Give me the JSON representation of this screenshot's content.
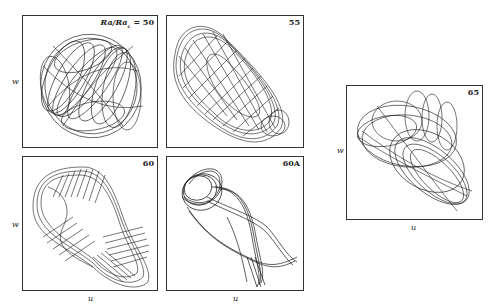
{
  "figure": {
    "panels": [
      {
        "id": "p50",
        "label": "Ra/Ra_c = 50",
        "label_main": "Ra/Ra",
        "label_sub": "c",
        "label_eq": " = 50",
        "xlabel": "",
        "ylabel": "w"
      },
      {
        "id": "p55",
        "label": "55",
        "xlabel": "",
        "ylabel": ""
      },
      {
        "id": "p60",
        "label": "60",
        "xlabel": "u",
        "ylabel": "w"
      },
      {
        "id": "p60A",
        "label": "60A",
        "xlabel": "u",
        "ylabel": ""
      },
      {
        "id": "p65",
        "label": "65",
        "xlabel": "u",
        "ylabel": "w"
      }
    ],
    "axes": {
      "x": "u",
      "y": "w"
    },
    "line_color": "#1a1a1a",
    "frame_color": "#333333"
  }
}
